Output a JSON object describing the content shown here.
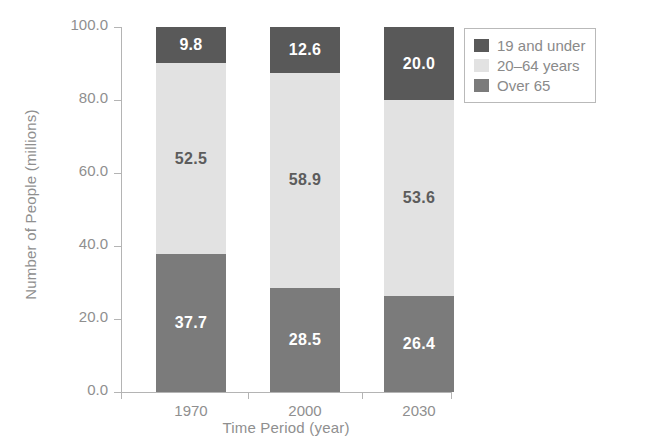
{
  "chart_data": {
    "type": "bar",
    "subtype": "stacked-bar",
    "title": "",
    "xlabel": "Time Period (year)",
    "ylabel": "Number of People (millions)",
    "categories": [
      "1970",
      "2000",
      "2030"
    ],
    "ylim": [
      0,
      100
    ],
    "yticks": [
      "0.0",
      "20.0",
      "40.0",
      "60.0",
      "80.0",
      "100.0"
    ],
    "ytick_values": [
      0,
      20,
      40,
      60,
      80,
      100
    ],
    "grid": false,
    "legend_position": "top-right",
    "stack_order_bottom_to_top": [
      "Over 65",
      "20–64 years",
      "19 and under"
    ],
    "series": [
      {
        "name": "19 and under",
        "color": "#595959",
        "label_color": "#ffffff",
        "values": [
          9.8,
          12.6,
          20.0
        ],
        "labels": [
          "9.8",
          "12.6",
          "20.0"
        ]
      },
      {
        "name": "20–64 years",
        "color": "#e2e2e2",
        "label_color": "#5c5c5c",
        "values": [
          52.5,
          58.9,
          53.6
        ],
        "labels": [
          "52.5",
          "58.9",
          "53.6"
        ]
      },
      {
        "name": "Over 65",
        "color": "#7b7b7b",
        "label_color": "#ffffff",
        "values": [
          37.7,
          28.5,
          26.4
        ],
        "labels": [
          "37.7",
          "28.5",
          "26.4"
        ]
      }
    ]
  },
  "legend": {
    "items": [
      {
        "label": "19 and under",
        "color": "#595959"
      },
      {
        "label": "20–64 years",
        "color": "#e2e2e2"
      },
      {
        "label": "Over 65",
        "color": "#7b7b7b"
      }
    ]
  },
  "axes": {
    "y_title": "Number of People (millions)",
    "x_title": "Time Period (year)"
  },
  "colors": {
    "background": "#ffffff",
    "axis": "#b4b4b4",
    "text": "#8f8f8f",
    "segment_dark": "#595959",
    "segment_light": "#e2e2e2",
    "segment_medium": "#7b7b7b"
  }
}
